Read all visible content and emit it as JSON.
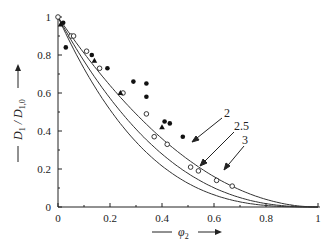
{
  "chart_data": {
    "type": "scatter",
    "title": "",
    "xlabel": "φ2",
    "ylabel": "D1 / D1,0",
    "xlim": [
      0,
      1
    ],
    "ylim": [
      0,
      1
    ],
    "x_ticks": [
      "0",
      "0.2",
      "0.4",
      "0.6",
      "0.8",
      "1"
    ],
    "y_ticks": [
      "0",
      "0.2",
      "0.4",
      "0.6",
      "0.8",
      "1"
    ],
    "grid": false,
    "curves": [
      {
        "name": "2",
        "exponent": 2,
        "style": "solid line"
      },
      {
        "name": "2.5",
        "exponent": 2.5,
        "style": "solid line"
      },
      {
        "name": "3",
        "exponent": 3,
        "style": "solid line"
      }
    ],
    "series": [
      {
        "name": "filled circles",
        "marker": "filled-circle",
        "points": [
          [
            0.02,
            0.97
          ],
          [
            0.03,
            0.84
          ],
          [
            0.13,
            0.8
          ],
          [
            0.19,
            0.73
          ],
          [
            0.29,
            0.66
          ],
          [
            0.34,
            0.65
          ],
          [
            0.34,
            0.58
          ],
          [
            0.41,
            0.45
          ],
          [
            0.43,
            0.44
          ],
          [
            0.48,
            0.37
          ]
        ]
      },
      {
        "name": "open circles",
        "marker": "open-circle",
        "points": [
          [
            0.0,
            1.0
          ],
          [
            0.05,
            0.9
          ],
          [
            0.06,
            0.9
          ],
          [
            0.11,
            0.82
          ],
          [
            0.16,
            0.73
          ],
          [
            0.25,
            0.6
          ],
          [
            0.34,
            0.49
          ],
          [
            0.37,
            0.37
          ],
          [
            0.42,
            0.33
          ],
          [
            0.51,
            0.21
          ],
          [
            0.54,
            0.19
          ],
          [
            0.61,
            0.14
          ],
          [
            0.67,
            0.11
          ]
        ]
      },
      {
        "name": "filled triangles",
        "marker": "filled-triangle",
        "points": [
          [
            0.01,
            0.96
          ],
          [
            0.14,
            0.77
          ],
          [
            0.24,
            0.6
          ],
          [
            0.4,
            0.42
          ]
        ]
      }
    ],
    "annotations": [
      {
        "text": "2",
        "arrow_to": [
          0.26,
          0.58
        ]
      },
      {
        "text": "2.5",
        "arrow_to": [
          0.3,
          0.46
        ]
      },
      {
        "text": "3",
        "arrow_to": [
          0.39,
          0.38
        ]
      }
    ]
  },
  "axes": {
    "x_label_main": "φ",
    "x_label_sub": "2",
    "y_label_main": "D",
    "y_label_sub1": "1",
    "y_label_mid": " / D",
    "y_label_sub2": "1,0"
  },
  "labels": {
    "curve_2": "2",
    "curve_25": "2.5",
    "curve_3": "3"
  }
}
